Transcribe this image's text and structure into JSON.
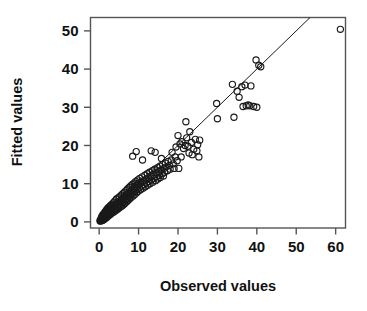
{
  "chart_data": {
    "type": "scatter",
    "title": "",
    "xlabel": "Observed values",
    "ylabel": "Fitted values",
    "xlim": [
      -2.2,
      62.5
    ],
    "ylim": [
      -1.6,
      53.5
    ],
    "xticks": [
      0,
      10,
      20,
      30,
      40,
      50,
      60
    ],
    "yticks": [
      0,
      10,
      20,
      30,
      40,
      50
    ],
    "xticklabels": [
      "0",
      "10",
      "20",
      "30",
      "40",
      "50",
      "60"
    ],
    "yticklabels": [
      "0",
      "10",
      "20",
      "30",
      "40",
      "50"
    ],
    "grid": false,
    "legend": null,
    "marker": "open-circle",
    "marker_color": "#1a1a1a",
    "marker_radius": 3.1,
    "frame_color": "#555555",
    "reference_line": {
      "name": "identity-line",
      "type": "line",
      "slope": 1.0,
      "intercept": 0.0,
      "x_from": 0.0,
      "x_to": 54.5,
      "color": "#1a1a1a",
      "width": 1.0
    },
    "series": [
      {
        "name": "observed-vs-fitted",
        "points": [
          [
            0.2,
            0.3
          ],
          [
            0.3,
            0.2
          ],
          [
            0.4,
            0.5
          ],
          [
            0.5,
            0.4
          ],
          [
            0.5,
            0.9
          ],
          [
            0.6,
            0.3
          ],
          [
            0.6,
            1.1
          ],
          [
            0.7,
            0.6
          ],
          [
            0.7,
            1.4
          ],
          [
            0.8,
            0.4
          ],
          [
            0.8,
            1.0
          ],
          [
            0.9,
            0.7
          ],
          [
            0.9,
            1.8
          ],
          [
            1.0,
            0.5
          ],
          [
            1.0,
            1.2
          ],
          [
            1.1,
            0.9
          ],
          [
            1.1,
            2.0
          ],
          [
            1.2,
            0.6
          ],
          [
            1.2,
            1.5
          ],
          [
            1.3,
            1.0
          ],
          [
            1.3,
            2.3
          ],
          [
            1.4,
            0.8
          ],
          [
            1.4,
            1.7
          ],
          [
            1.5,
            1.2
          ],
          [
            1.5,
            2.6
          ],
          [
            1.6,
            1.0
          ],
          [
            1.6,
            1.9
          ],
          [
            1.7,
            1.4
          ],
          [
            1.7,
            2.9
          ],
          [
            1.8,
            1.1
          ],
          [
            1.8,
            2.2
          ],
          [
            1.9,
            1.6
          ],
          [
            1.9,
            3.2
          ],
          [
            2.0,
            1.3
          ],
          [
            2.0,
            2.5
          ],
          [
            2.1,
            1.8
          ],
          [
            2.1,
            3.4
          ],
          [
            2.2,
            1.5
          ],
          [
            2.2,
            2.8
          ],
          [
            2.3,
            2.0
          ],
          [
            2.3,
            3.7
          ],
          [
            2.4,
            1.7
          ],
          [
            2.5,
            3.0
          ],
          [
            2.6,
            2.2
          ],
          [
            2.6,
            4.0
          ],
          [
            2.7,
            1.9
          ],
          [
            2.8,
            3.3
          ],
          [
            2.9,
            2.5
          ],
          [
            2.9,
            4.3
          ],
          [
            3.0,
            2.1
          ],
          [
            3.1,
            3.6
          ],
          [
            3.2,
            2.7
          ],
          [
            3.2,
            4.6
          ],
          [
            3.3,
            2.4
          ],
          [
            3.4,
            3.9
          ],
          [
            3.5,
            3.0
          ],
          [
            3.6,
            5.0
          ],
          [
            3.7,
            2.6
          ],
          [
            3.8,
            4.2
          ],
          [
            3.9,
            3.3
          ],
          [
            4.0,
            5.5
          ],
          [
            4.1,
            2.9
          ],
          [
            4.2,
            4.5
          ],
          [
            4.3,
            3.6
          ],
          [
            4.4,
            6.0
          ],
          [
            4.5,
            3.2
          ],
          [
            4.6,
            4.9
          ],
          [
            4.7,
            3.9
          ],
          [
            4.8,
            6.3
          ],
          [
            4.9,
            3.5
          ],
          [
            5.0,
            5.2
          ],
          [
            5.1,
            4.2
          ],
          [
            5.2,
            6.6
          ],
          [
            5.3,
            3.8
          ],
          [
            5.4,
            5.6
          ],
          [
            5.5,
            4.6
          ],
          [
            5.6,
            7.0
          ],
          [
            5.7,
            4.1
          ],
          [
            5.8,
            6.0
          ],
          [
            5.9,
            5.0
          ],
          [
            6.0,
            7.4
          ],
          [
            6.1,
            4.4
          ],
          [
            6.2,
            6.4
          ],
          [
            6.3,
            5.4
          ],
          [
            6.4,
            7.8
          ],
          [
            6.5,
            4.8
          ],
          [
            6.6,
            6.8
          ],
          [
            6.7,
            5.8
          ],
          [
            6.8,
            8.2
          ],
          [
            6.9,
            5.2
          ],
          [
            7.0,
            7.2
          ],
          [
            7.1,
            6.2
          ],
          [
            7.2,
            8.6
          ],
          [
            7.3,
            5.6
          ],
          [
            7.4,
            7.6
          ],
          [
            7.5,
            6.6
          ],
          [
            7.6,
            9.0
          ],
          [
            7.7,
            6.0
          ],
          [
            7.8,
            8.0
          ],
          [
            7.9,
            7.0
          ],
          [
            8.0,
            9.4
          ],
          [
            8.1,
            6.4
          ],
          [
            8.2,
            8.4
          ],
          [
            8.3,
            7.4
          ],
          [
            8.4,
            9.8
          ],
          [
            8.5,
            17.2
          ],
          [
            8.6,
            6.8
          ],
          [
            8.7,
            8.8
          ],
          [
            8.8,
            7.8
          ],
          [
            8.9,
            10.2
          ],
          [
            9.0,
            7.2
          ],
          [
            9.1,
            9.2
          ],
          [
            9.2,
            8.2
          ],
          [
            9.3,
            10.6
          ],
          [
            9.4,
            18.4
          ],
          [
            9.5,
            7.6
          ],
          [
            9.6,
            9.6
          ],
          [
            9.7,
            8.6
          ],
          [
            9.8,
            11.0
          ],
          [
            9.9,
            8.0
          ],
          [
            10.0,
            10.0
          ],
          [
            10.2,
            9.0
          ],
          [
            10.3,
            11.4
          ],
          [
            10.5,
            8.4
          ],
          [
            10.6,
            10.4
          ],
          [
            10.8,
            9.4
          ],
          [
            10.9,
            11.8
          ],
          [
            11.0,
            16.2
          ],
          [
            11.1,
            8.8
          ],
          [
            11.3,
            10.8
          ],
          [
            11.4,
            9.8
          ],
          [
            11.6,
            12.2
          ],
          [
            11.7,
            9.2
          ],
          [
            11.9,
            11.2
          ],
          [
            12.0,
            10.2
          ],
          [
            12.2,
            12.6
          ],
          [
            12.3,
            9.6
          ],
          [
            12.5,
            11.6
          ],
          [
            12.6,
            10.6
          ],
          [
            12.8,
            13.0
          ],
          [
            12.9,
            10.0
          ],
          [
            13.1,
            12.0
          ],
          [
            13.2,
            18.6
          ],
          [
            13.3,
            11.0
          ],
          [
            13.5,
            13.4
          ],
          [
            13.6,
            10.4
          ],
          [
            13.8,
            12.4
          ],
          [
            13.9,
            11.4
          ],
          [
            14.1,
            13.8
          ],
          [
            14.2,
            18.2
          ],
          [
            14.3,
            10.8
          ],
          [
            14.5,
            12.8
          ],
          [
            14.6,
            11.8
          ],
          [
            14.8,
            14.2
          ],
          [
            14.9,
            11.2
          ],
          [
            15.1,
            13.2
          ],
          [
            15.2,
            12.2
          ],
          [
            15.4,
            14.6
          ],
          [
            15.5,
            11.6
          ],
          [
            15.7,
            13.6
          ],
          [
            15.8,
            16.6
          ],
          [
            16.0,
            12.6
          ],
          [
            16.1,
            15.0
          ],
          [
            16.3,
            12.0
          ],
          [
            16.4,
            14.0
          ],
          [
            16.6,
            13.0
          ],
          [
            16.8,
            15.4
          ],
          [
            17.0,
            14.4
          ],
          [
            17.3,
            13.4
          ],
          [
            17.5,
            15.8
          ],
          [
            17.8,
            14.8
          ],
          [
            18.0,
            13.8
          ],
          [
            18.3,
            16.2
          ],
          [
            18.5,
            18.2
          ],
          [
            18.8,
            15.2
          ],
          [
            19.0,
            14.0
          ],
          [
            19.3,
            17.0
          ],
          [
            19.5,
            19.6
          ],
          [
            19.8,
            16.0
          ],
          [
            20.0,
            22.6
          ],
          [
            20.2,
            14.0
          ],
          [
            20.5,
            20.4
          ],
          [
            20.8,
            17.0
          ],
          [
            21.0,
            21.0
          ],
          [
            21.4,
            19.2
          ],
          [
            21.8,
            20.0
          ],
          [
            22.0,
            26.2
          ],
          [
            22.2,
            22.0
          ],
          [
            22.5,
            19.8
          ],
          [
            22.8,
            18.0
          ],
          [
            23.0,
            23.6
          ],
          [
            23.4,
            20.8
          ],
          [
            23.6,
            17.6
          ],
          [
            24.0,
            19.0
          ],
          [
            24.4,
            21.6
          ],
          [
            24.8,
            18.6
          ],
          [
            25.0,
            20.2
          ],
          [
            25.3,
            17.0
          ],
          [
            25.5,
            21.4
          ],
          [
            29.8,
            31.0
          ],
          [
            30.0,
            27.0
          ],
          [
            33.8,
            36.0
          ],
          [
            34.2,
            27.4
          ],
          [
            35.0,
            34.2
          ],
          [
            35.5,
            32.6
          ],
          [
            36.2,
            35.4
          ],
          [
            36.5,
            30.2
          ],
          [
            37.0,
            35.8
          ],
          [
            37.3,
            30.4
          ],
          [
            37.8,
            30.6
          ],
          [
            38.2,
            30.4
          ],
          [
            38.5,
            35.6
          ],
          [
            39.2,
            30.2
          ],
          [
            39.8,
            42.4
          ],
          [
            40.0,
            30.0
          ],
          [
            40.5,
            41.0
          ],
          [
            41.0,
            40.6
          ],
          [
            61.2,
            50.4
          ]
        ]
      }
    ]
  },
  "axis_titles": {
    "x": "Observed values",
    "y": "Fitted values"
  }
}
